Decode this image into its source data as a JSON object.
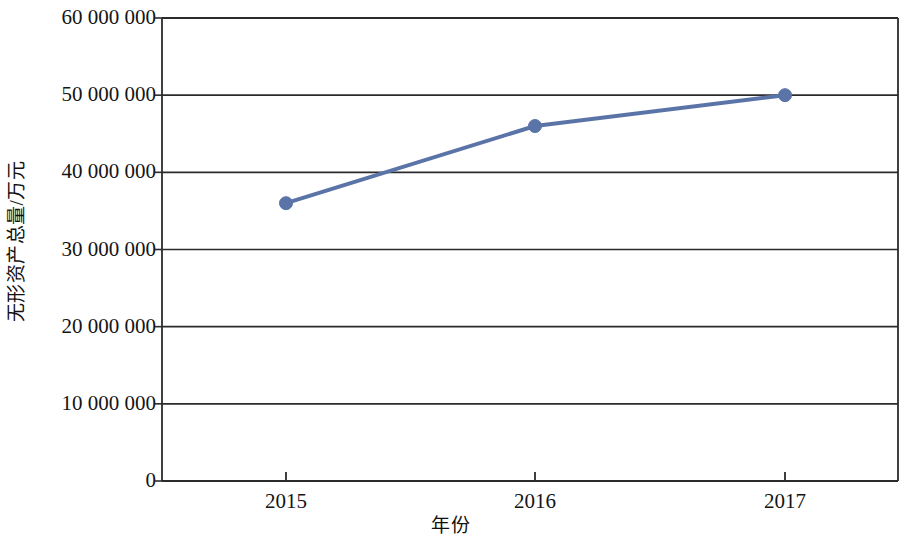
{
  "chart_data": {
    "type": "line",
    "title": "",
    "subtitle": "",
    "xlabel": "年份",
    "ylabel": "无形资产总量/万元",
    "categories": [
      "2015",
      "2016",
      "2017"
    ],
    "x": [
      2015,
      2016,
      2017
    ],
    "series": [
      {
        "name": "无形资产总量",
        "values": [
          36000000,
          46000000,
          50000000
        ],
        "color": "#5b74a8",
        "marker": "circle",
        "line_width": 4,
        "marker_size": 13
      }
    ],
    "values": [
      36000000,
      46000000,
      50000000
    ],
    "ylim": [
      0,
      60000000
    ],
    "ytick_values": [
      0,
      10000000,
      20000000,
      30000000,
      40000000,
      50000000,
      60000000
    ],
    "ytick_labels": [
      "0",
      "10 000 000",
      "20 000 000",
      "30 000 000",
      "40 000 000",
      "50 000 000",
      "60 000 000"
    ],
    "xtick_labels": [
      "2015",
      "2016",
      "2017"
    ],
    "grid": {
      "horizontal": true,
      "vertical": false,
      "color": "#2b2b2b"
    },
    "legend": {
      "visible": false,
      "position": "none",
      "entries": []
    },
    "axis": {
      "color": "#2b2b2b",
      "left_spine": true,
      "bottom_spine": true,
      "top_spine": true,
      "right_spine": true,
      "tick_marks": "outward"
    },
    "annotations": [],
    "background_color": "#ffffff"
  },
  "geometry": {
    "plot_left": 162,
    "plot_right": 898,
    "plot_top": 18,
    "plot_bottom": 481,
    "tick_x": [
      286,
      535,
      785
    ],
    "tick_y": [
      481,
      404,
      327,
      249,
      172,
      95,
      18
    ],
    "point_px": [
      {
        "x": 286,
        "y": 204
      },
      {
        "x": 535,
        "y": 127
      },
      {
        "x": 785,
        "y": 96
      }
    ]
  }
}
